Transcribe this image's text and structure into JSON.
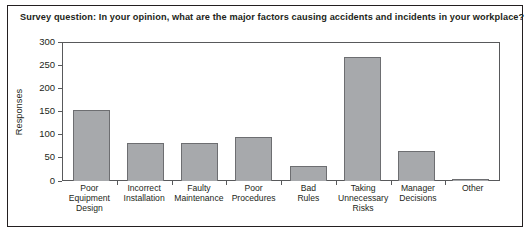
{
  "chart_data": {
    "type": "bar",
    "title": "Survey question: In your opinion, what are the major factors causing accidents and incidents in your workplace?",
    "xlabel": "",
    "ylabel": "Responses",
    "categories": [
      "Poor Equipment Design",
      "Incorrect Installation",
      "Faulty Maintenance",
      "Poor Procedures",
      "Bad Rules",
      "Taking Unnecessary Risks",
      "Manager Decisions",
      "Other"
    ],
    "category_lines": [
      "Poor\nEquipment\nDesign",
      "Incorrect\nInstallation",
      "Faulty\nMaintenance",
      "Poor\nProcedures",
      "Bad\nRules",
      "Taking\nUnnecessary\nRisks",
      "Manager\nDecisions",
      "Other"
    ],
    "values": [
      153,
      81,
      83,
      95,
      33,
      268,
      64,
      5
    ],
    "ylim": [
      0,
      300
    ],
    "yticks": [
      0,
      50,
      100,
      150,
      200,
      250,
      300
    ],
    "ytick_labels": [
      "0",
      "50",
      "100",
      "150",
      "200",
      "250",
      "300"
    ],
    "grid": false,
    "legend": false,
    "bar_color": "#a7a9ac",
    "bar_border_color": "#6d6e71",
    "axis_color": "#58595b",
    "text_color": "#231f20"
  },
  "figure": {
    "caption_partial": ""
  }
}
